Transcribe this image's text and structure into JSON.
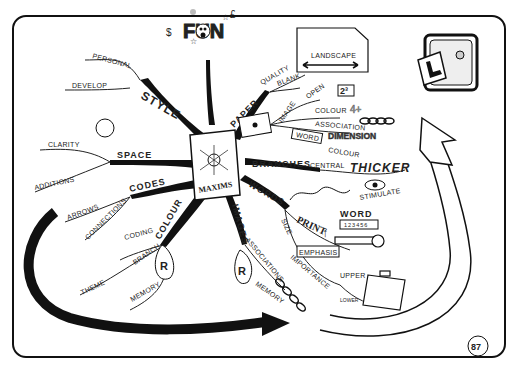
{
  "page": {
    "page_number": "87",
    "central_image_label": "MAXIMS"
  },
  "branches": {
    "style": {
      "label": "STYLE",
      "children": [
        "PERSONAL",
        "DEVELOP"
      ]
    },
    "space": {
      "label": "SPACE",
      "children": [
        "CLARITY",
        "ADDITIONS"
      ]
    },
    "codes": {
      "label": "CODES",
      "children": [
        "ARROWS",
        "CONNECTIONS"
      ]
    },
    "colour": {
      "label": "COLOUR",
      "children": [
        "CODING",
        "BRANCH",
        "THEME",
        "MEMORY"
      ]
    },
    "images": {
      "label": "IMAGES",
      "children": [
        "ASSOCIATIONS",
        "MEMORY"
      ]
    },
    "words": {
      "label": "WORDS",
      "children": [
        "PRINT",
        "SIZE",
        "EMPHASIS",
        "IMPORTANCE",
        "UPPER",
        "LOWER",
        "WORD",
        "KEY"
      ]
    },
    "branches": {
      "label": "BRANCHES",
      "children": [
        "CENTRAL",
        "THICKER",
        "STIMULATE"
      ]
    },
    "paper": {
      "label": "PAPER",
      "children": [
        "QUALITY",
        "BLANK",
        "LANDSCAPE"
      ]
    },
    "image_sub": {
      "label": "IMAGE",
      "children": [
        "OPEN",
        "COLOUR",
        "ASSOCIATION"
      ]
    },
    "word_box": {
      "label": "WORD",
      "children": [
        "DIMENSION",
        "COLOUR"
      ]
    },
    "fun": {
      "label": "FUN"
    }
  },
  "icons": {
    "open_badge": "2³",
    "colour_badge": "4+",
    "memory_badge": "R",
    "word_ruler": "123456"
  }
}
